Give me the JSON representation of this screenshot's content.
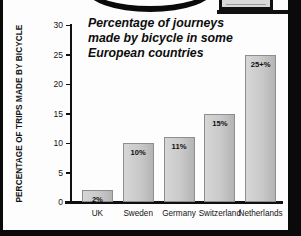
{
  "document": {
    "kind": "scanned-textbook-page",
    "background_color": "#000000",
    "paper_color": "#fdfdfd"
  },
  "artifacts": {
    "top_arc_name": "oval-graphic-arc",
    "top_right_panel_name": "clipped-panel-fragment"
  },
  "chart_data": {
    "type": "bar",
    "title": "Percentage of journeys made by bicycle in some European countries",
    "title_lines": [
      "Percentage of journeys",
      "made by bicycle in some",
      "European countries"
    ],
    "xlabel": "",
    "ylabel": "PERCENTAGE OF TRIPS MADE BY BICYCLE",
    "categories": [
      "UK",
      "Sweden",
      "Germany",
      "Switzerland",
      "Netherlands"
    ],
    "values": [
      2,
      10,
      11,
      15,
      25
    ],
    "data_labels": [
      "2%",
      "10%",
      "11%",
      "15%",
      "25+%"
    ],
    "ylim": [
      0,
      30
    ],
    "yticks": [
      0,
      5,
      10,
      15,
      20,
      25,
      30
    ],
    "ytick_labels": [
      "0",
      "5",
      "10",
      "15",
      "20",
      "25",
      "30"
    ],
    "grid": false,
    "legend": false,
    "bar_color": "#c9c9c9",
    "bar_edge_color": "#8e8e8e",
    "axis_color": "#101010",
    "text_color": "#141414"
  }
}
